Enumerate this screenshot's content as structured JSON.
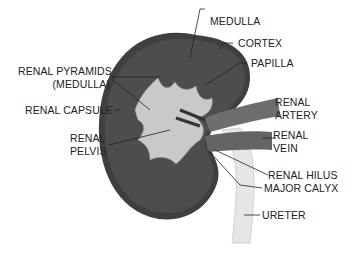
{
  "diagram": {
    "labels": {
      "medulla": "MEDULLA",
      "cortex": "CORTEX",
      "papilla": "PAPILLA",
      "renal_pyramids_1": "RENAL PYRAMIDS",
      "renal_pyramids_2": "(MEDULLA)",
      "renal_capsule": "RENAL CAPSULE",
      "renal_pelvis_1": "RENAL",
      "renal_pelvis_2": "PELVIS",
      "renal_artery_1": "RENAL",
      "renal_artery_2": "ARTERY",
      "renal_vein_1": "RENAL",
      "renal_vein_2": "VEIN",
      "renal_hilus": "RENAL HILUS",
      "major_calyx": "MAJOR CALYX",
      "ureter": "URETER"
    },
    "colors": {
      "kidney_outer": "#3f3f3f",
      "kidney_inner": "#505050",
      "pelvis": "#c9c9c9",
      "vessel": "#6e6e6e",
      "ureter": "#e4e4e4",
      "leader_line": "#222222"
    }
  }
}
